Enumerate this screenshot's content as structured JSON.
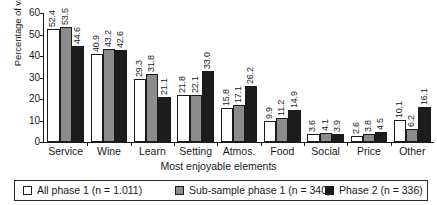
{
  "chart_data": {
    "type": "bar",
    "title": "",
    "xlabel": "Most enjoyable elements",
    "ylabel": "Percentage of valid cases",
    "ylim": [
      0,
      60
    ],
    "yticks": [
      0,
      10,
      20,
      30,
      40,
      50,
      60
    ],
    "grid": false,
    "legend_position": "bottom",
    "categories": [
      "Service",
      "Wine",
      "Learn",
      "Setting",
      "Atmos.",
      "Food",
      "Social",
      "Price",
      "Other"
    ],
    "series": [
      {
        "name": "All phase 1 (n = 1.011)",
        "color": "#ffffff",
        "values": [
          52.4,
          40.9,
          29.3,
          21.8,
          15.8,
          9.9,
          3.6,
          2.6,
          10.1
        ]
      },
      {
        "name": "Sub-sample phase 1 (n = 340)",
        "color": "#8c8c8c",
        "values": [
          53.5,
          43.2,
          31.8,
          22.1,
          17.1,
          11.2,
          4.1,
          3.8,
          6.2
        ]
      },
      {
        "name": "Phase 2 (n = 336)",
        "color": "#1c1c1c",
        "values": [
          44.6,
          42.6,
          21.1,
          33.0,
          26.2,
          14.9,
          3.9,
          4.5,
          16.1
        ]
      }
    ]
  }
}
